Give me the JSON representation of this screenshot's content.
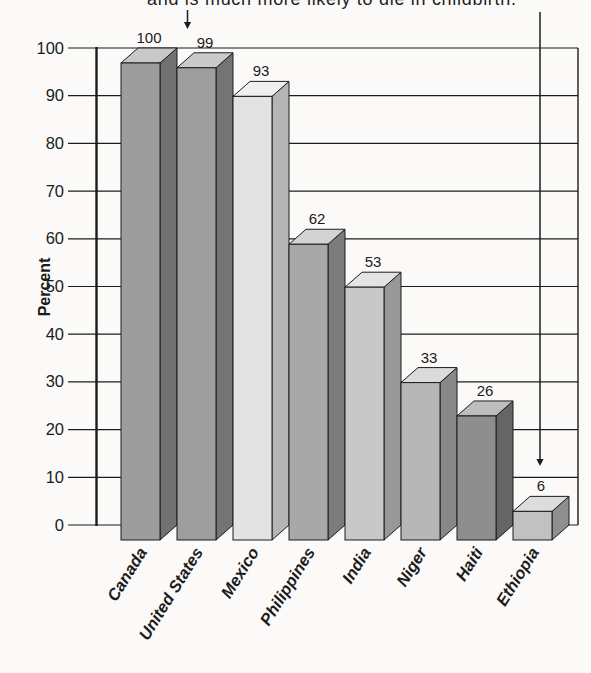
{
  "caption": {
    "text": "and is much more likely to die in childbirth."
  },
  "chart_data": {
    "type": "bar",
    "style": "3d-column",
    "title": "",
    "xlabel": "",
    "ylabel": "Percent",
    "categories": [
      "Canada",
      "United States",
      "Mexico",
      "Philippines",
      "India",
      "Niger",
      "Haiti",
      "Ethiopia"
    ],
    "values": [
      100,
      99,
      93,
      62,
      53,
      33,
      26,
      6
    ],
    "ylim": [
      0,
      100
    ],
    "yticks": [
      0,
      10,
      20,
      30,
      40,
      50,
      60,
      70,
      80,
      90,
      100
    ],
    "grid": "horizontal",
    "legend": "none",
    "bar_colors": [
      {
        "front": "#9d9d9d",
        "side": "#717171",
        "top": "#c8c8c8"
      },
      {
        "front": "#9e9e9e",
        "side": "#747474",
        "top": "#cacaca"
      },
      {
        "front": "#e3e3e3",
        "side": "#b5b5b5",
        "top": "#efefef"
      },
      {
        "front": "#a8a8a8",
        "side": "#7c7c7c",
        "top": "#d3d3d3"
      },
      {
        "front": "#c8c8c8",
        "side": "#989898",
        "top": "#e3e3e3"
      },
      {
        "front": "#b7b7b7",
        "side": "#888888",
        "top": "#dbdbdb"
      },
      {
        "front": "#8e8e8e",
        "side": "#656565",
        "top": "#bdbdbd"
      },
      {
        "front": "#c1c1c1",
        "side": "#8f8f8f",
        "top": "#dddddd"
      }
    ],
    "annotations": [
      {
        "name": "arrow-to-united-states",
        "points_to": "United States",
        "x": 187.5,
        "y_start": 10,
        "y_end": 29
      },
      {
        "name": "arrow-to-ethiopia",
        "points_to": "Ethiopia",
        "x": 540,
        "y_start": 12,
        "y_end": 466
      }
    ]
  },
  "colors": {
    "ink": "#1c1c1c",
    "background": "#fbfaf8"
  }
}
